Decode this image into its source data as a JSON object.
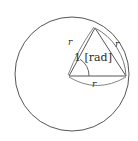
{
  "figure": {
    "type": "geometry-diagram",
    "background_color": "#ffffff",
    "stroke_color": "#555555",
    "text_color": "#2b2b2b",
    "circle": {
      "center_x": 72,
      "center_y": 74,
      "radius": 57
    },
    "vertices": {
      "center": {
        "x": 69,
        "y": 76
      },
      "right": {
        "x": 126,
        "y": 76
      },
      "apex": {
        "x": 95,
        "y": 28
      }
    },
    "angle": {
      "value": "1 [rad]",
      "arc_radius": 20
    },
    "labels": [
      {
        "id": "radius-left-label",
        "text": "r",
        "x": 71,
        "y": 43
      },
      {
        "id": "radius-right-label",
        "text": "r",
        "x": 117,
        "y": 45
      },
      {
        "id": "radius-bottom-label",
        "text": "r",
        "x": 94,
        "y": 85
      },
      {
        "id": "angle-label",
        "text": "1 [rad]",
        "x": 75,
        "y": 58
      }
    ]
  }
}
